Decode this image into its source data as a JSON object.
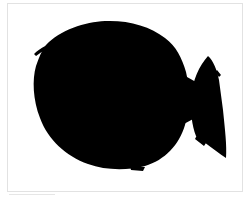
{
  "image": {
    "subject": "fish silhouette",
    "style": "black ink sketch on white",
    "colors": {
      "ink": "#000000",
      "background": "#ffffff",
      "frame": "#e2e2e2"
    }
  }
}
